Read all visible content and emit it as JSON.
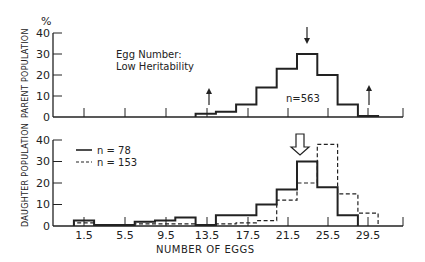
{
  "chart_data": [
    {
      "type": "bar",
      "panel": "top",
      "ylabel": "PARENT POPULATION",
      "yunit": "%",
      "ylim": [
        0,
        40
      ],
      "yticks": [
        "0",
        "10",
        "20",
        "30",
        "40"
      ],
      "title": "Egg Number:",
      "subtitle": "Low Heritability",
      "annotation": "n=563",
      "bin_width": 2,
      "series": [
        {
          "name": "n=563",
          "style": "solid",
          "bins": [
            {
              "start": 12.5,
              "end": 14.5,
              "value": 1.5
            },
            {
              "start": 14.5,
              "end": 16.5,
              "value": 2.5
            },
            {
              "start": 16.5,
              "end": 18.5,
              "value": 6
            },
            {
              "start": 18.5,
              "end": 20.5,
              "value": 14
            },
            {
              "start": 20.5,
              "end": 22.5,
              "value": 23
            },
            {
              "start": 22.5,
              "end": 24.5,
              "value": 30
            },
            {
              "start": 24.5,
              "end": 26.5,
              "value": 20
            },
            {
              "start": 26.5,
              "end": 28.5,
              "value": 6
            },
            {
              "start": 28.5,
              "end": 30.5,
              "value": 0.5
            }
          ]
        }
      ],
      "markers": [
        {
          "type": "down-arrow",
          "x": 23.5,
          "meaning": "parent mean"
        },
        {
          "type": "up-arrow",
          "x": 14.0,
          "meaning": "selection threshold low"
        },
        {
          "type": "up-arrow",
          "x": 30.0,
          "meaning": "selection threshold high"
        }
      ]
    },
    {
      "type": "bar",
      "panel": "bottom",
      "ylabel": "DAUGHTER POPULATION",
      "ylim": [
        0,
        40
      ],
      "yticks": [
        "0",
        "10",
        "20",
        "30",
        "40"
      ],
      "xlabel": "NUMBER OF EGGS",
      "xticks": [
        "1.5",
        "5.5",
        "9.5",
        "13.5",
        "17.5",
        "21.5",
        "25.5",
        "29.5"
      ],
      "legend": [
        {
          "label": "n = 78",
          "style": "solid"
        },
        {
          "label": "n = 153",
          "style": "dashed"
        }
      ],
      "bin_width": 2,
      "series": [
        {
          "name": "n = 78",
          "style": "solid",
          "bins": [
            {
              "start": 0.5,
              "end": 2.5,
              "value": 2.5
            },
            {
              "start": 2.5,
              "end": 4.5,
              "value": 0.5
            },
            {
              "start": 4.5,
              "end": 6.5,
              "value": 0.5
            },
            {
              "start": 6.5,
              "end": 8.5,
              "value": 2
            },
            {
              "start": 8.5,
              "end": 10.5,
              "value": 2.5
            },
            {
              "start": 10.5,
              "end": 12.5,
              "value": 4
            },
            {
              "start": 12.5,
              "end": 14.5,
              "value": 0.5
            },
            {
              "start": 14.5,
              "end": 16.5,
              "value": 5
            },
            {
              "start": 16.5,
              "end": 18.5,
              "value": 5
            },
            {
              "start": 18.5,
              "end": 20.5,
              "value": 10
            },
            {
              "start": 20.5,
              "end": 22.5,
              "value": 17
            },
            {
              "start": 22.5,
              "end": 24.5,
              "value": 30
            },
            {
              "start": 24.5,
              "end": 26.5,
              "value": 18
            },
            {
              "start": 26.5,
              "end": 28.5,
              "value": 5
            }
          ]
        },
        {
          "name": "n = 153",
          "style": "dashed",
          "bins": [
            {
              "start": 0.5,
              "end": 2.5,
              "value": 1.5
            },
            {
              "start": 2.5,
              "end": 4.5,
              "value": 0.5
            },
            {
              "start": 4.5,
              "end": 6.5,
              "value": 0.5
            },
            {
              "start": 6.5,
              "end": 8.5,
              "value": 1
            },
            {
              "start": 8.5,
              "end": 10.5,
              "value": 1
            },
            {
              "start": 10.5,
              "end": 12.5,
              "value": 1
            },
            {
              "start": 12.5,
              "end": 14.5,
              "value": 0.5
            },
            {
              "start": 14.5,
              "end": 16.5,
              "value": 1
            },
            {
              "start": 16.5,
              "end": 18.5,
              "value": 1.5
            },
            {
              "start": 18.5,
              "end": 20.5,
              "value": 2.5
            },
            {
              "start": 20.5,
              "end": 22.5,
              "value": 12
            },
            {
              "start": 22.5,
              "end": 24.5,
              "value": 20
            },
            {
              "start": 24.5,
              "end": 26.5,
              "value": 38
            },
            {
              "start": 26.5,
              "end": 28.5,
              "value": 15
            },
            {
              "start": 28.5,
              "end": 30.5,
              "value": 6
            }
          ]
        }
      ],
      "markers": [
        {
          "type": "hollow-down-arrow",
          "x": 23.0,
          "meaning": "daughter mean"
        }
      ]
    }
  ],
  "labels": {
    "percent": "%",
    "top_ylabel": "PARENT POPULATION",
    "bottom_ylabel": "DAUGHTER POPULATION",
    "title_line1": "Egg Number:",
    "title_line2": "Low Heritability",
    "n_top": "n=563",
    "legend_solid": "n = 78",
    "legend_dashed": "n = 153",
    "xlabel": "NUMBER OF EGGS",
    "yticks": [
      "0",
      "10",
      "20",
      "30",
      "40"
    ],
    "xticks": [
      "1.5",
      "5.5",
      "9.5",
      "13.5",
      "17.5",
      "21.5",
      "25.5",
      "29.5"
    ]
  }
}
